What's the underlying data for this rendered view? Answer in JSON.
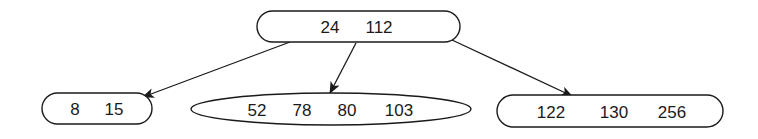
{
  "diagram": {
    "type": "b-tree",
    "root": {
      "keys": [
        "24",
        "112"
      ]
    },
    "children": [
      {
        "keys": [
          "8",
          "15"
        ]
      },
      {
        "keys": [
          "52",
          "78",
          "80",
          "103"
        ]
      },
      {
        "keys": [
          "122",
          "130",
          "256"
        ]
      }
    ],
    "colors": {
      "stroke": "#1a1a1a",
      "background": "#ffffff"
    }
  }
}
